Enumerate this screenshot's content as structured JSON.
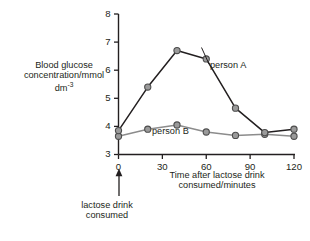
{
  "chart_data": {
    "type": "line",
    "title": "",
    "xlabel": "Time after lactose drink consumed/minutes",
    "ylabel": "Blood glucose concentration/mmol dm-3",
    "ylabel_line1": "Blood glucose",
    "ylabel_line2": "concentration/mmol",
    "ylabel_line3": "dm",
    "ylabel_line3_sup": "-3",
    "xlabel_line1": "Time after lactose drink",
    "xlabel_line2": "consumed/minutes",
    "x": [
      0,
      20,
      40,
      60,
      80,
      100,
      120
    ],
    "xlim": [
      0,
      120
    ],
    "ylim": [
      3,
      8
    ],
    "xticks": [
      0,
      30,
      60,
      90,
      120
    ],
    "yticks": [
      3,
      4,
      5,
      6,
      7,
      8
    ],
    "xtick_labels": [
      "0",
      "30",
      "60",
      "90",
      "120"
    ],
    "ytick_labels": [
      "3",
      "4",
      "5",
      "6",
      "7",
      "8"
    ],
    "grid": false,
    "legend_position": "inline-annotation",
    "series": [
      {
        "name": "person A",
        "label": "person A",
        "color": "#231f20",
        "marker_fill": "#9a9a9a",
        "values": [
          3.85,
          5.4,
          6.7,
          6.4,
          4.65,
          3.78,
          3.9
        ]
      },
      {
        "name": "person B",
        "label": "person B",
        "color": "#8c8c8c",
        "marker_fill": "#9a9a9a",
        "values": [
          3.65,
          3.9,
          4.05,
          3.8,
          3.68,
          3.72,
          3.65
        ]
      }
    ],
    "annotations": [
      {
        "name": "lactose-drink-arrow",
        "at_x": 0,
        "text_line1": "lactose drink",
        "text_line2": "consumed",
        "text": "lactose drink consumed"
      }
    ]
  },
  "colors": {
    "axis": "#231f20",
    "person_a_line": "#231f20",
    "person_b_line": "#8c8c8c",
    "marker_fill": "#9a9a9a",
    "marker_edge": "#4d4d4d",
    "background": "#ffffff"
  }
}
